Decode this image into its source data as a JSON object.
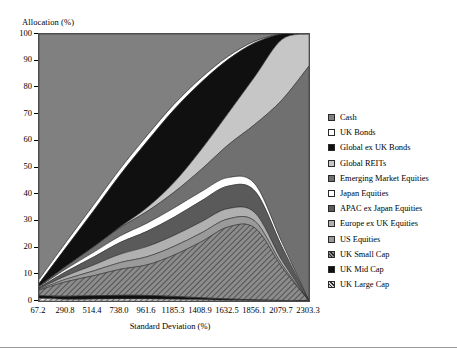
{
  "chart_data": {
    "type": "area",
    "stacked": true,
    "title": "",
    "xlabel": "Standard Deviation (%)",
    "ylabel": "Allocation (%)",
    "xtick_labels": [
      "67.2",
      "290.8",
      "514.4",
      "738.0",
      "961.6",
      "1185.3",
      "1408.9",
      "1632.5",
      "1856.1",
      "2079.7",
      "2303.3"
    ],
    "x": [
      67.2,
      290.8,
      514.4,
      738.0,
      961.6,
      1185.3,
      1408.9,
      1632.5,
      1856.1,
      2079.7,
      2303.3
    ],
    "ytick_labels": [
      "0",
      "10",
      "20",
      "30",
      "40",
      "50",
      "60",
      "70",
      "80",
      "90",
      "100"
    ],
    "ylim": [
      0,
      100
    ],
    "grid": false,
    "legend_position": "right",
    "series": [
      {
        "name": "Cash",
        "fill": "#808080",
        "pattern": "solid",
        "values": [
          92.0,
          78.0,
          65.0,
          52.0,
          40.0,
          29.0,
          19.0,
          10.0,
          3.0,
          0.0,
          0.0
        ]
      },
      {
        "name": "UK Bonds",
        "fill": "#ffffff",
        "pattern": "solid",
        "values": [
          1.5,
          2.0,
          2.2,
          2.3,
          2.3,
          2.2,
          1.9,
          1.4,
          0.7,
          0.0,
          0.0
        ]
      },
      {
        "name": "Global ex UK Bonds",
        "fill": "#101010",
        "pattern": "solid",
        "values": [
          1.0,
          7.0,
          13.5,
          20.0,
          26.0,
          30.0,
          29.0,
          24.0,
          14.0,
          2.0,
          0.0
        ]
      },
      {
        "name": "Global REITs",
        "fill": "#c6c6c6",
        "pattern": "solid",
        "values": [
          0.0,
          0.0,
          0.0,
          0.3,
          1.5,
          4.0,
          8.5,
          14.0,
          20.0,
          22.0,
          12.0
        ]
      },
      {
        "name": "Emerging Market Equities",
        "fill": "#707070",
        "pattern": "solid",
        "values": [
          0.2,
          1.0,
          2.0,
          3.2,
          4.6,
          6.5,
          9.5,
          14.5,
          25.0,
          52.0,
          88.0
        ]
      },
      {
        "name": "Japan Equities",
        "fill": "#ffffff",
        "pattern": "solid",
        "values": [
          0.3,
          1.0,
          1.8,
          2.5,
          3.2,
          3.8,
          4.0,
          3.8,
          3.0,
          1.5,
          0.0
        ]
      },
      {
        "name": "APAC ex Japan Equities",
        "fill": "#5a5a5a",
        "pattern": "solid",
        "values": [
          0.4,
          1.6,
          3.0,
          4.5,
          6.0,
          7.5,
          9.0,
          10.0,
          9.0,
          5.0,
          0.0
        ]
      },
      {
        "name": "Europe ex UK Equities",
        "fill": "#b0b0b0",
        "pattern": "solid",
        "values": [
          0.3,
          1.2,
          2.2,
          3.2,
          4.0,
          4.5,
          4.8,
          4.6,
          3.5,
          1.5,
          0.0
        ]
      },
      {
        "name": "US Equities",
        "fill": "#9a9a9a",
        "pattern": "solid",
        "values": [
          0.3,
          1.0,
          1.8,
          2.6,
          3.2,
          3.6,
          3.8,
          3.6,
          2.8,
          1.0,
          0.0
        ]
      },
      {
        "name": "UK Small Cap",
        "fill": "#8c8c8c",
        "pattern": "hatch-forward",
        "values": [
          2.0,
          5.4,
          7.5,
          10.0,
          12.0,
          17.0,
          24.0,
          32.0,
          30.0,
          12.0,
          0.0
        ]
      },
      {
        "name": "UK Mid Cap",
        "fill": "#101010",
        "pattern": "solid",
        "values": [
          1.0,
          1.2,
          1.3,
          1.4,
          1.4,
          1.2,
          0.9,
          0.6,
          0.3,
          0.1,
          0.0
        ]
      },
      {
        "name": "UK Large Cap",
        "fill": "#d8d8d8",
        "pattern": "hatch-forward",
        "values": [
          1.0,
          0.6,
          0.7,
          0.8,
          0.8,
          0.7,
          0.5,
          0.3,
          0.2,
          0.1,
          0.0
        ]
      }
    ]
  },
  "axes": {
    "y_title": "Allocation (%)",
    "x_title": "Standard Deviation (%)"
  }
}
